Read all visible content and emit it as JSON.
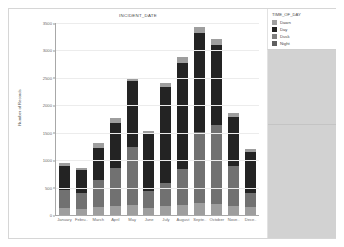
{
  "chart_data": {
    "type": "bar",
    "title": "INCIDENT_DATE",
    "xlabel": "",
    "ylabel": "Number of Records",
    "ylim": [
      0,
      3500
    ],
    "yticks": [
      3500,
      3000,
      2500,
      2000,
      1500,
      1000,
      500,
      0
    ],
    "ytick_labels": [
      "3500",
      "3000",
      "2500",
      "2000",
      "1500",
      "1000",
      "500",
      "0"
    ],
    "grid": true,
    "stacked": true,
    "legend_position": "top-right",
    "categories": [
      "January",
      "Febru..",
      "March",
      "April",
      "May",
      "June",
      "July",
      "August",
      "Septe..",
      "October",
      "Nove..",
      "Dece.."
    ],
    "series": [
      {
        "name": "Dawn",
        "color": "#9e9e9e",
        "values": [
          120,
          110,
          150,
          160,
          190,
          130,
          170,
          180,
          210,
          200,
          170,
          140
        ]
      },
      {
        "name": "Night",
        "color": "#717171",
        "values": [
          330,
          300,
          480,
          700,
          1050,
          310,
          420,
          650,
          1300,
          1450,
          730,
          260
        ]
      },
      {
        "name": "Day",
        "color": "#232323",
        "values": [
          440,
          410,
          600,
          820,
          1200,
          1050,
          1740,
          1940,
          1800,
          1450,
          880,
          750
        ]
      },
      {
        "name": "Dusk",
        "color": "#9e9e9e",
        "values": [
          60,
          45,
          80,
          90,
          60,
          50,
          70,
          110,
          120,
          110,
          80,
          60
        ]
      }
    ],
    "totals": [
      950,
      865,
      1310,
      1770,
      2500,
      1540,
      2400,
      2880,
      3430,
      3210,
      1860,
      1210
    ]
  },
  "legend": {
    "title": "TIME_OF_DAY",
    "items": [
      {
        "label": "Dawn",
        "color": "#9e9e9e"
      },
      {
        "label": "Day",
        "color": "#232323"
      },
      {
        "label": "Dusk",
        "color": "#7f7f7f"
      },
      {
        "label": "Night",
        "color": "#5f5f5f"
      }
    ]
  }
}
